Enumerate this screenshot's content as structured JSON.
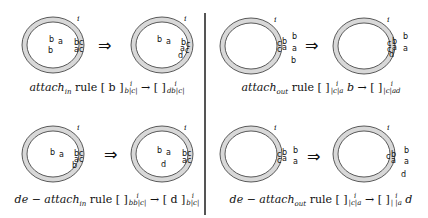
{
  "figure": {
    "membrane_label": "i",
    "arrow_symbol": "⇒",
    "ring_fill": "#d8d8d8",
    "ring_stroke": "#333333"
  },
  "panels": [
    {
      "id": "attach-in",
      "caption": {
        "rule_name": "attach",
        "rule_sub": "in",
        "word": "rule",
        "lhs_inner": "[ b ]",
        "lhs_sup": "i",
        "lhs_sub": "b|c|",
        "arrow": "→",
        "rhs_inner": "[ ]",
        "rhs_sup": "i",
        "rhs_sub": "db|c|",
        "trail": ""
      },
      "before": {
        "inside": [
          "b",
          "a",
          "b"
        ],
        "membrane": [
          "b",
          "c",
          "a",
          "c"
        ],
        "outside": []
      },
      "after": {
        "inside": [
          "b",
          "a"
        ],
        "membrane": [
          "b",
          "c",
          "a",
          "c",
          "d"
        ],
        "outside": []
      }
    },
    {
      "id": "attach-out",
      "caption": {
        "rule_name": "attach",
        "rule_sub": "out",
        "word": "rule",
        "lhs_inner": "[ ]",
        "lhs_sup": "i",
        "lhs_sub": "|c|a",
        "lhs_trail": "b",
        "arrow": "→",
        "rhs_inner": "[ ]",
        "rhs_sup": "i",
        "rhs_sub": "|c|ad",
        "trail": ""
      },
      "before": {
        "inside": [],
        "membrane": [
          "c",
          "b",
          "c",
          "a"
        ],
        "outside": [
          "b",
          "a",
          "b"
        ]
      },
      "after": {
        "inside": [],
        "membrane": [
          "c",
          "b",
          "c",
          "a",
          "d"
        ],
        "outside": [
          "b",
          "a"
        ]
      }
    },
    {
      "id": "de-attach-in",
      "caption": {
        "rule_name": "de − attach",
        "rule_sub": "in",
        "word": "rule",
        "lhs_inner": "[ ]",
        "lhs_sup": "i",
        "lhs_sub": "bb|c|",
        "arrow": "→",
        "rhs_inner": "[ d ]",
        "rhs_sup": "i",
        "rhs_sub": "b|c|",
        "trail": ""
      },
      "before": {
        "inside": [
          "b",
          "a"
        ],
        "membrane": [
          "b",
          "c",
          "a",
          "c",
          "b"
        ],
        "outside": []
      },
      "after": {
        "inside": [
          "b",
          "a",
          "d"
        ],
        "membrane": [
          "b",
          "c",
          "a",
          "c"
        ],
        "outside": []
      }
    },
    {
      "id": "de-attach-out",
      "caption": {
        "rule_name": "de − attach",
        "rule_sub": "out",
        "word": "rule",
        "lhs_inner": "[ ]",
        "lhs_sup": "i",
        "lhs_sub": "|c|a",
        "arrow": "→",
        "rhs_inner": "[ ]",
        "rhs_sup": "i",
        "rhs_sub": "| |a",
        "trail": "d"
      },
      "before": {
        "inside": [],
        "membrane": [
          "c",
          "b",
          "c",
          "a"
        ],
        "outside": [
          "b",
          "a"
        ]
      },
      "after": {
        "inside": [],
        "membrane": [
          "c",
          "b",
          "a"
        ],
        "outside": [
          "b",
          "a",
          "d"
        ]
      }
    }
  ]
}
